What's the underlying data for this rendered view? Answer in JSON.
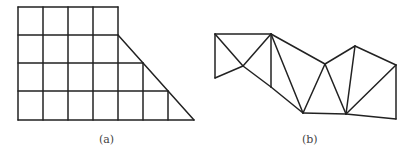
{
  "figures": [
    {
      "id": "a",
      "caption": "(a)",
      "description": "Square grid mesh, 4 columns by 4 rows on top-left with a stepped right side cut by a diagonal edge forming a trapezoid",
      "grid": {
        "columns_x": [
          18,
          43,
          68,
          93,
          118,
          143,
          168
        ],
        "rows_y": [
          7,
          35,
          63,
          91,
          120
        ]
      }
    },
    {
      "id": "b",
      "caption": "(b)",
      "description": "Triangular mesh strip with 11 vertices"
    }
  ],
  "colors": {
    "stroke": "#222222",
    "background": "#ffffff",
    "caption": "#444444"
  }
}
